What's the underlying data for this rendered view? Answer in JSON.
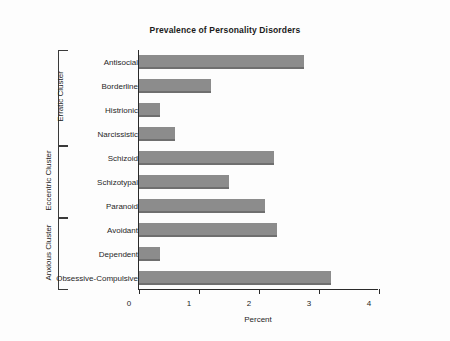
{
  "chart_data": {
    "type": "bar",
    "orientation": "horizontal",
    "title": "Prevalence of Personality Disorders",
    "xlabel": "Percent",
    "ylabel": "",
    "xlim": [
      0,
      4
    ],
    "xticks": [
      "0",
      "1",
      "2",
      "3",
      "4"
    ],
    "grid": false,
    "legend": null,
    "bar_color": "#8c8c8c",
    "categories": [
      "Antisocial",
      "Borderline",
      "Histrionic",
      "Narcissistic",
      "Schizoid",
      "Schizotypal",
      "Paranoid",
      "Avoidant",
      "Dependent",
      "Obsessive-Compulsive"
    ],
    "values": [
      2.75,
      1.2,
      0.35,
      0.6,
      2.25,
      1.5,
      2.1,
      2.3,
      0.35,
      3.2
    ],
    "groups": [
      {
        "label": "Erratic Cluster",
        "start_index": 0,
        "end_index": 3
      },
      {
        "label": "Eccentric Cluster",
        "start_index": 4,
        "end_index": 6
      },
      {
        "label": "Anxious Cluster",
        "start_index": 7,
        "end_index": 9
      }
    ]
  }
}
